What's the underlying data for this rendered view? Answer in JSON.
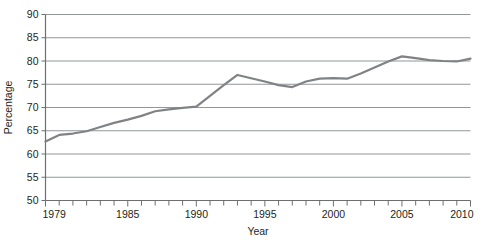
{
  "chart_data": {
    "type": "line",
    "title": "",
    "xlabel": "Year",
    "ylabel": "Percentage",
    "xlim": [
      1979,
      2010
    ],
    "ylim": [
      50,
      90
    ],
    "grid": "horizontal",
    "legend": "none",
    "line_color": "#808285",
    "axis_color": "#939598",
    "text_color": "#231f20",
    "x_tick_labels": [
      "1979",
      "1985",
      "1990",
      "1995",
      "2000",
      "2005",
      "2010"
    ],
    "x_tick_values": [
      1979,
      1985,
      1990,
      1995,
      2000,
      2005,
      2010
    ],
    "x_minor_ticks_every": 1,
    "y_tick_labels": [
      "50",
      "55",
      "60",
      "65",
      "70",
      "75",
      "80",
      "85",
      "90"
    ],
    "y_tick_values": [
      50,
      55,
      60,
      65,
      70,
      75,
      80,
      85,
      90
    ],
    "x": [
      1979,
      1980,
      1981,
      1982,
      1983,
      1984,
      1985,
      1986,
      1987,
      1988,
      1989,
      1990,
      1991,
      1992,
      1993,
      1994,
      1995,
      1996,
      1997,
      1998,
      1999,
      2000,
      2001,
      2002,
      2003,
      2004,
      2005,
      2006,
      2007,
      2008,
      2009,
      2010
    ],
    "values": [
      62.7,
      64.1,
      64.4,
      64.9,
      65.8,
      66.7,
      67.4,
      68.2,
      69.2,
      69.6,
      69.9,
      70.2,
      72.5,
      74.8,
      77.0,
      76.3,
      75.6,
      74.8,
      74.4,
      75.6,
      76.2,
      76.3,
      76.2,
      77.3,
      78.6,
      79.9,
      81.0,
      80.6,
      80.2,
      80.0,
      79.9,
      80.5
    ],
    "series": [
      {
        "name": "Percentage",
        "values": [
          62.7,
          64.1,
          64.4,
          64.9,
          65.8,
          66.7,
          67.4,
          68.2,
          69.2,
          69.6,
          69.9,
          70.2,
          72.5,
          74.8,
          77.0,
          76.3,
          75.6,
          74.8,
          74.4,
          75.6,
          76.2,
          76.3,
          76.2,
          77.3,
          78.6,
          79.9,
          81.0,
          80.6,
          80.2,
          80.0,
          79.9,
          80.5
        ]
      }
    ]
  }
}
